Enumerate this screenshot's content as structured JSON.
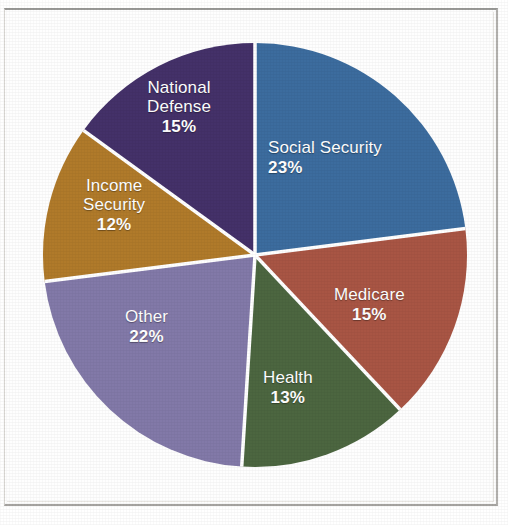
{
  "chart_data": {
    "type": "pie",
    "title": "",
    "subtitle": "",
    "xlabel": "",
    "ylabel": "",
    "legend_position": "none",
    "labels_inside_slices": true,
    "start_angle_deg": 0,
    "direction": "clockwise",
    "categories": [
      "Social Security",
      "Medicare",
      "Health",
      "Other",
      "Income Security",
      "National Defense"
    ],
    "values": [
      23,
      15,
      13,
      22,
      12,
      15
    ],
    "value_unit": "%",
    "total": 100,
    "slices": [
      {
        "name": "Social Security",
        "value": 23,
        "value_label": "23%",
        "color": "#3c6c9e",
        "start_deg": 0,
        "end_deg": 82.8
      },
      {
        "name": "Medicare",
        "value": 15,
        "value_label": "15%",
        "color": "#a85544",
        "start_deg": 82.8,
        "end_deg": 136.8
      },
      {
        "name": "Health",
        "value": 13,
        "value_label": "13%",
        "color": "#4c6640",
        "start_deg": 136.8,
        "end_deg": 183.6
      },
      {
        "name": "Other",
        "value": 22,
        "value_label": "22%",
        "color": "#8279a8",
        "start_deg": 183.6,
        "end_deg": 262.8
      },
      {
        "name": "Income Security",
        "value": 12,
        "value_label": "12%",
        "color": "#b07a2a",
        "start_deg": 262.8,
        "end_deg": 306.0
      },
      {
        "name": "National Defense",
        "value": 15,
        "value_label": "15%",
        "color": "#443169",
        "start_deg": 306.0,
        "end_deg": 360.0
      }
    ]
  },
  "labels": {
    "social_security": {
      "name": "Social Security",
      "pct": "23%"
    },
    "medicare": {
      "name": "Medicare",
      "pct": "15%"
    },
    "health": {
      "name": "Health",
      "pct": "13%"
    },
    "other": {
      "name": "Other",
      "pct": "22%"
    },
    "income_security_line1": "Income",
    "income_security_line2": "Security",
    "income_security_pct": "12%",
    "national_defense_line1": "National",
    "national_defense_line2": "Defense",
    "national_defense_pct": "15%"
  },
  "style": {
    "slice_separator_color": "#ffffff",
    "label_text_color": "#ffffff",
    "page_background": "#ffffff",
    "frame_border_color": "#9a9a98"
  }
}
